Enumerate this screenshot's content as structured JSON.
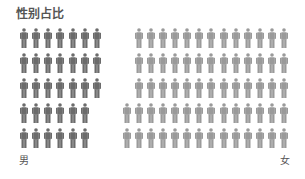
{
  "chart_data": {
    "type": "pictogram",
    "title": "性别占比",
    "series": [
      {
        "name": "男",
        "value": 33,
        "color": "#6b6b6b",
        "row_counts": [
          7,
          7,
          7,
          6,
          6
        ]
      },
      {
        "name": "女",
        "value": 67,
        "color": "#9a9a9a",
        "row_counts": [
          13,
          13,
          13,
          14,
          14
        ]
      }
    ],
    "total": 100,
    "unit": "person-icon",
    "labels": {
      "left": "男",
      "right": "女"
    }
  },
  "header": {
    "title": "性别占比"
  },
  "legend": {
    "male": "男",
    "female": "女"
  }
}
